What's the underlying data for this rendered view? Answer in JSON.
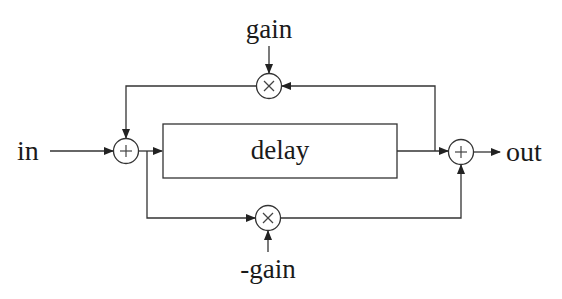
{
  "diagram": {
    "type": "signal-flow block diagram (allpass comb filter)",
    "labels": {
      "input": "in",
      "output": "out",
      "delay": "delay",
      "feedback_gain": "gain",
      "feedforward_gain": "-gain"
    },
    "nodes": [
      {
        "id": "sum_in",
        "kind": "adder",
        "symbol": "+"
      },
      {
        "id": "delay",
        "kind": "block",
        "label": "delay"
      },
      {
        "id": "mult_feedback",
        "kind": "multiplier",
        "symbol": "×",
        "coefficient": "gain"
      },
      {
        "id": "mult_feedforward",
        "kind": "multiplier",
        "symbol": "×",
        "coefficient": "-gain"
      },
      {
        "id": "sum_out",
        "kind": "adder",
        "symbol": "+"
      }
    ],
    "edges": [
      {
        "from": "in",
        "to": "sum_in"
      },
      {
        "from": "sum_in",
        "to": "delay"
      },
      {
        "from": "sum_in",
        "to": "mult_feedforward"
      },
      {
        "from": "delay",
        "to": "sum_out"
      },
      {
        "from": "delay",
        "to": "mult_feedback"
      },
      {
        "from": "mult_feedback",
        "to": "sum_in"
      },
      {
        "from": "mult_feedforward",
        "to": "sum_out"
      },
      {
        "from": "sum_out",
        "to": "out"
      }
    ],
    "symbols": {
      "adder": "+",
      "multiplier": "×"
    }
  }
}
